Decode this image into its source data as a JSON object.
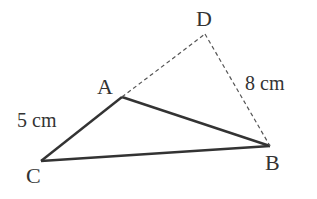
{
  "diagram": {
    "type": "geometry-triangle",
    "colors": {
      "stroke": "#333333",
      "text": "#333333",
      "background": "#ffffff"
    },
    "points": [
      {
        "id": "A",
        "label": "A",
        "x": 122,
        "y": 97
      },
      {
        "id": "B",
        "label": "B",
        "x": 270,
        "y": 146
      },
      {
        "id": "C",
        "label": "C",
        "x": 41,
        "y": 161
      },
      {
        "id": "D",
        "label": "D",
        "x": 205,
        "y": 34
      }
    ],
    "segments": [
      {
        "from": "C",
        "to": "A",
        "style": "solid"
      },
      {
        "from": "A",
        "to": "B",
        "style": "solid"
      },
      {
        "from": "C",
        "to": "B",
        "style": "solid"
      },
      {
        "from": "A",
        "to": "D",
        "style": "dashed"
      },
      {
        "from": "D",
        "to": "B",
        "style": "dashed"
      }
    ],
    "measurements": [
      {
        "segment": "CA",
        "label": "5 cm"
      },
      {
        "segment": "DB",
        "label": "8 cm"
      }
    ]
  }
}
